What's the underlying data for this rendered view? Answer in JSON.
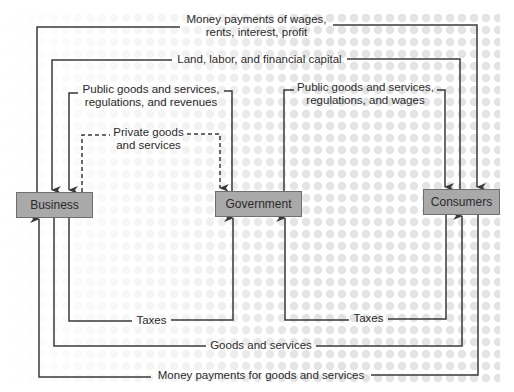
{
  "diagram": {
    "type": "circular-flow",
    "colors": {
      "line": "#3a3a3a",
      "box_fill": "#a9a9a9",
      "box_border": "#6e6e6e",
      "dot": "#e3e3e3",
      "text": "#2a2a2a"
    },
    "nodes": {
      "business": "Business",
      "government": "Government",
      "consumers": "Consumers"
    },
    "flows": {
      "wages_payments": {
        "line1": "Money payments of wages,",
        "line2": "rents, interest, profit",
        "from": "Business",
        "to": "Consumers"
      },
      "factors": {
        "label": "Land, labor, and financial capital",
        "from": "Consumers",
        "to": "Business"
      },
      "gov_to_business": {
        "line1": "Public goods and services,",
        "line2": "regulations, and revenues",
        "from": "Government",
        "to": "Business"
      },
      "private_goods": {
        "line1": "Private goods",
        "line2": "and services",
        "from": "Business",
        "to": "Government",
        "style": "dashed"
      },
      "gov_to_consumers": {
        "line1": "Public goods and services,",
        "line2": "regulations, and wages",
        "from": "Government",
        "to": "Consumers"
      },
      "business_taxes": {
        "label": "Taxes",
        "from": "Business",
        "to": "Government"
      },
      "consumer_taxes": {
        "label": "Taxes",
        "from": "Consumers",
        "to": "Government"
      },
      "goods_services": {
        "label": "Goods and services",
        "from": "Business",
        "to": "Consumers"
      },
      "goods_payments": {
        "label": "Money payments for goods and services",
        "from": "Consumers",
        "to": "Business"
      }
    }
  }
}
